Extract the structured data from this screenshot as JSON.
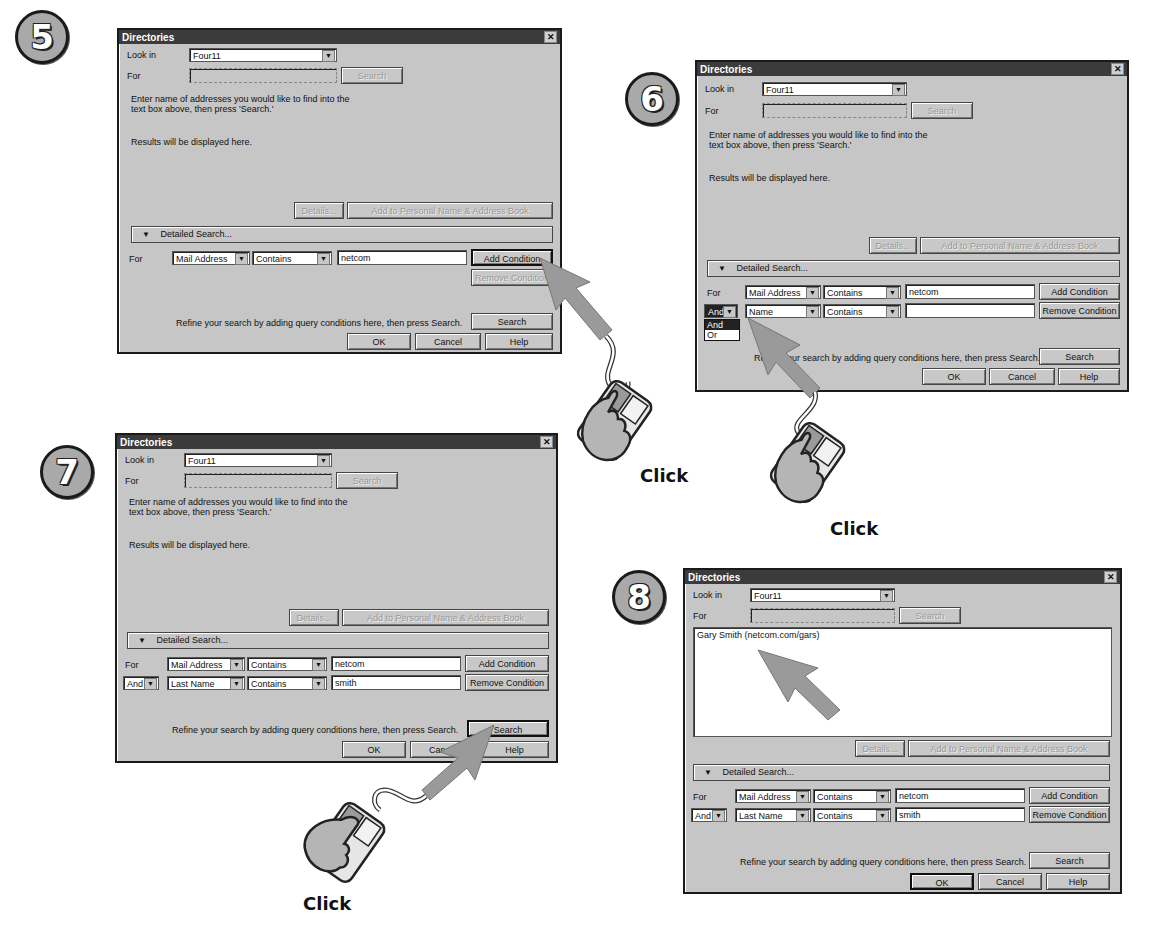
{
  "steps": [
    {
      "number": "5",
      "dialog": {
        "title": "Directories",
        "look_in_label": "Look in",
        "look_in_value": "Four11",
        "for_label": "For",
        "for_value": "",
        "search_top_label": "Search",
        "instructions_line1": "Enter name of addresses you would like to find into the",
        "instructions_line2": "text box above, then press 'Search.'",
        "results_text": "Results will be displayed here.",
        "details_label": "Details...",
        "add_to_book_label": "Add to Personal Name & Address Book",
        "detailed_search_label": "Detailed Search...",
        "conditions": [
          {
            "connector": "For",
            "field": "Mail Address",
            "operator": "Contains",
            "value": "netcom"
          }
        ],
        "add_condition_label": "Add Condition",
        "remove_condition_label": "Remove Condition",
        "refine_text": "Refine your search by adding query conditions here, then press Search.",
        "search_label": "Search",
        "ok_label": "OK",
        "cancel_label": "Cancel",
        "help_label": "Help"
      }
    },
    {
      "number": "6",
      "dialog": {
        "title": "Directories",
        "look_in_label": "Look in",
        "look_in_value": "Four11",
        "for_label": "For",
        "for_value": "",
        "search_top_label": "Search",
        "instructions_line1": "Enter name of addresses you would like to find into the",
        "instructions_line2": "text box above, then press 'Search.'",
        "results_text": "Results will be displayed here.",
        "details_label": "Details...",
        "add_to_book_label": "Add to Personal Name & Address Book",
        "detailed_search_label": "Detailed Search...",
        "conditions": [
          {
            "connector": "For",
            "field": "Mail Address",
            "operator": "Contains",
            "value": "netcom"
          },
          {
            "connector": "And",
            "field": "Name",
            "operator": "Contains",
            "value": ""
          }
        ],
        "connector_dropdown_options": [
          "And",
          "Or"
        ],
        "connector_dropdown_selected": "And",
        "add_condition_label": "Add Condition",
        "remove_condition_label": "Remove Condition",
        "refine_text": "Refine your search by adding query conditions here, then press Search.",
        "search_label": "Search",
        "ok_label": "OK",
        "cancel_label": "Cancel",
        "help_label": "Help"
      }
    },
    {
      "number": "7",
      "dialog": {
        "title": "Directories",
        "look_in_label": "Look in",
        "look_in_value": "Four11",
        "for_label": "For",
        "for_value": "",
        "search_top_label": "Search",
        "instructions_line1": "Enter name of addresses you would like to find into the",
        "instructions_line2": "text box above, then press 'Search.'",
        "results_text": "Results will be displayed here.",
        "details_label": "Details...",
        "add_to_book_label": "Add to Personal Name & Address Book",
        "detailed_search_label": "Detailed Search...",
        "conditions": [
          {
            "connector": "For",
            "field": "Mail Address",
            "operator": "Contains",
            "value": "netcom"
          },
          {
            "connector": "And",
            "field": "Last Name",
            "operator": "Contains",
            "value": "smith"
          }
        ],
        "add_condition_label": "Add Condition",
        "remove_condition_label": "Remove Condition",
        "refine_text": "Refine your search by adding query conditions here, then press Search.",
        "search_label": "Search",
        "ok_label": "OK",
        "cancel_label": "Cancel",
        "help_label": "Help"
      }
    },
    {
      "number": "8",
      "dialog": {
        "title": "Directories",
        "look_in_label": "Look in",
        "look_in_value": "Four11",
        "for_label": "For",
        "for_value": "",
        "search_top_label": "Search",
        "results": [
          "Gary Smith (netcom.com/gars)"
        ],
        "details_label": "Details...",
        "add_to_book_label": "Add to Personal Name & Address Book",
        "detailed_search_label": "Detailed Search...",
        "conditions": [
          {
            "connector": "For",
            "field": "Mail Address",
            "operator": "Contains",
            "value": "netcom"
          },
          {
            "connector": "And",
            "field": "Last Name",
            "operator": "Contains",
            "value": "smith"
          }
        ],
        "add_condition_label": "Add Condition",
        "remove_condition_label": "Remove Condition",
        "refine_text": "Refine your search by adding query conditions here, then press Search.",
        "search_label": "Search",
        "ok_label": "OK",
        "cancel_label": "Cancel",
        "help_label": "Help"
      }
    }
  ],
  "annotations": {
    "click_labels": [
      "Click",
      "Click",
      "Click"
    ],
    "close_glyph": "✕",
    "dropdown_glyph": "▼",
    "triangle_glyph": "▼"
  },
  "colors": {
    "dialog_bg": "#c6c6c6",
    "titlebar": "#3b3b3b",
    "arrow": "#9a9a9a",
    "badge": "#a9a9a9"
  }
}
